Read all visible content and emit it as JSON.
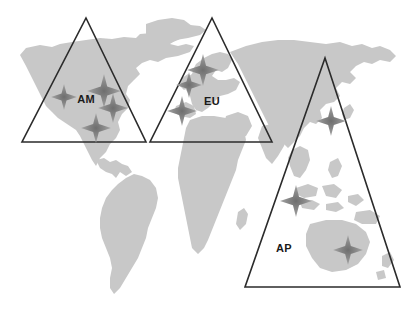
{
  "diagram": {
    "type": "world-map-region-diagram",
    "canvas": {
      "width": 419,
      "height": 311
    },
    "colors": {
      "background": "#ffffff",
      "landmass": "#c8c8c8",
      "triangle_stroke": "#2b2b2b",
      "marker": "#8a8a8a",
      "marker_core": "#707070",
      "label_text": "#1a1a1a"
    },
    "regions": [
      {
        "id": "AM",
        "label": "AM",
        "label_position": {
          "x": 86,
          "y": 103
        },
        "triangle": {
          "apex": {
            "x": 86,
            "y": 18
          },
          "left": {
            "x": 22,
            "y": 142
          },
          "right": {
            "x": 146,
            "y": 142
          }
        },
        "marker_count": 4
      },
      {
        "id": "EU",
        "label": "EU",
        "label_position": {
          "x": 212,
          "y": 105
        },
        "triangle": {
          "apex": {
            "x": 212,
            "y": 18
          },
          "left": {
            "x": 150,
            "y": 142
          },
          "right": {
            "x": 272,
            "y": 142
          }
        },
        "marker_count": 3
      },
      {
        "id": "AP",
        "label": "AP",
        "label_position": {
          "x": 284,
          "y": 252
        },
        "triangle": {
          "apex": {
            "x": 325,
            "y": 58
          },
          "left": {
            "x": 245,
            "y": 287
          },
          "right": {
            "x": 400,
            "y": 287
          }
        },
        "marker_count": 3
      }
    ],
    "markers": [
      {
        "region": "AM",
        "x": 64,
        "y": 97,
        "size": 13
      },
      {
        "region": "AM",
        "x": 104,
        "y": 91,
        "size": 17
      },
      {
        "region": "AM",
        "x": 113,
        "y": 108,
        "size": 15
      },
      {
        "region": "AM",
        "x": 96,
        "y": 128,
        "size": 15
      },
      {
        "region": "EU",
        "x": 203,
        "y": 70,
        "size": 16
      },
      {
        "region": "EU",
        "x": 189,
        "y": 85,
        "size": 13
      },
      {
        "region": "EU",
        "x": 182,
        "y": 111,
        "size": 15
      },
      {
        "region": "AP",
        "x": 331,
        "y": 121,
        "size": 15
      },
      {
        "region": "AP",
        "x": 296,
        "y": 201,
        "size": 16
      },
      {
        "region": "AP",
        "x": 348,
        "y": 250,
        "size": 15
      }
    ]
  }
}
